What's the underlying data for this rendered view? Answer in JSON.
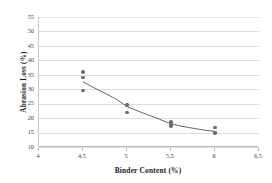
{
  "chart_data": {
    "type": "scatter",
    "title": "",
    "xlabel": "Binder Content (%)",
    "ylabel": "Abrasion Loss (%)",
    "xlim": [
      4,
      6.5
    ],
    "ylim": [
      10,
      55
    ],
    "grid": true,
    "legend": "none",
    "decimal_separator": ",",
    "xticks": [
      4,
      4.5,
      5,
      5.5,
      6,
      6.5
    ],
    "xtick_labels": [
      "4",
      "4,5",
      "5",
      "5,5",
      "6",
      "6,5"
    ],
    "yticks": [
      10,
      15,
      20,
      25,
      30,
      35,
      40,
      45,
      50,
      55
    ],
    "ytick_labels": [
      "10",
      "15",
      "20",
      "25",
      "30",
      "35",
      "40",
      "45",
      "50",
      "55"
    ],
    "x": [
      4.5,
      4.5,
      4.5,
      5.0,
      5.0,
      5.0,
      5.5,
      5.5,
      5.5,
      6.0,
      6.0,
      6.0
    ],
    "y": [
      35.9,
      34.0,
      29.6,
      24.8,
      24.3,
      22.0,
      18.7,
      17.8,
      17.3,
      16.7,
      15.1,
      14.8
    ],
    "points": [
      {
        "x": 4.5,
        "y": 35.9
      },
      {
        "x": 4.5,
        "y": 34.0
      },
      {
        "x": 4.5,
        "y": 29.6
      },
      {
        "x": 5.0,
        "y": 24.8
      },
      {
        "x": 5.0,
        "y": 24.3
      },
      {
        "x": 5.0,
        "y": 22.0
      },
      {
        "x": 5.5,
        "y": 18.7
      },
      {
        "x": 5.5,
        "y": 17.8
      },
      {
        "x": 5.5,
        "y": 17.3
      },
      {
        "x": 6.0,
        "y": 16.7
      },
      {
        "x": 6.0,
        "y": 15.1
      },
      {
        "x": 6.0,
        "y": 14.8
      }
    ],
    "trendline": {
      "type": "power-fit",
      "points": [
        {
          "x": 4.5,
          "y": 32.6
        },
        {
          "x": 4.62,
          "y": 30.6
        },
        {
          "x": 4.75,
          "y": 28.6
        },
        {
          "x": 4.87,
          "y": 26.7
        },
        {
          "x": 5.0,
          "y": 24.0
        },
        {
          "x": 5.12,
          "y": 22.5
        },
        {
          "x": 5.25,
          "y": 21.0
        },
        {
          "x": 5.37,
          "y": 19.6
        },
        {
          "x": 5.5,
          "y": 18.0
        },
        {
          "x": 5.62,
          "y": 17.2
        },
        {
          "x": 5.75,
          "y": 16.5
        },
        {
          "x": 5.87,
          "y": 15.9
        },
        {
          "x": 6.0,
          "y": 15.4
        }
      ]
    },
    "marker": {
      "shape": "circle",
      "color": "#6e6e6e",
      "size": 3.4
    },
    "line_color": "#555555"
  }
}
